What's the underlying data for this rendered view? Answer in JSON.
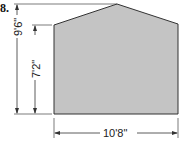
{
  "problem": {
    "number": "8.",
    "shape_fill": "#c4c4c4",
    "stroke": "#333333"
  },
  "dimensions": {
    "overall_height": "9'6\"",
    "wall_height": "7'2\"",
    "width": "10'8\""
  }
}
